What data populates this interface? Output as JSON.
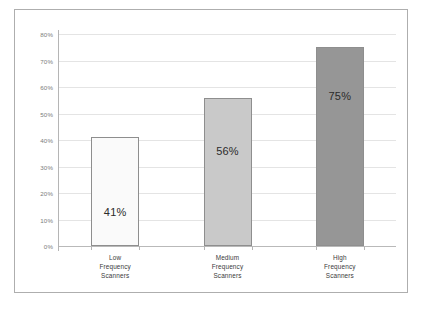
{
  "chart_data": {
    "type": "bar",
    "title": "",
    "subtitle": "",
    "xlabel": "",
    "ylabel": "",
    "categories": [
      "Low Frequency Scanners",
      "Medium Frequency Scanners",
      "High Frequency Scanners"
    ],
    "category_lines": [
      [
        "Low",
        "Frequency",
        "Scanners"
      ],
      [
        "Medium",
        "Frequency",
        "Scanners"
      ],
      [
        "High",
        "Frequency",
        "Scanners"
      ]
    ],
    "values": [
      41,
      56,
      75
    ],
    "value_labels": [
      "41%",
      "56%",
      "75%"
    ],
    "bar_colors": [
      "#fafafa",
      "#c9c9c9",
      "#969696"
    ],
    "bar_border_color": "#8e8e8e",
    "ylim": [
      0,
      80
    ],
    "ytick_values": [
      80,
      70,
      60,
      50,
      40,
      30,
      20,
      10,
      0
    ],
    "ytick_labels": [
      "80%",
      "70%",
      "60%",
      "50%",
      "40%",
      "30%",
      "20%",
      "10%",
      "0%"
    ],
    "grid": true,
    "gridline_color": "#e4e4e4",
    "axis_color": "#b5b5b5",
    "legend": null,
    "legend_position": "none",
    "frame_border_color": "#aeaeae",
    "background_color": "#ffffff"
  }
}
